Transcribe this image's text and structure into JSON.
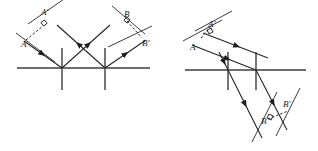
{
  "figure": {
    "title": "Reflection of a light beam by two mirrors (plane-mirror pair) — two configurations",
    "kind": "physics-ray-diagram",
    "background_color": "#ffffff",
    "line_color": "#3d3d3d",
    "ray_color": "#262626",
    "label_color": "#1b1b1b",
    "panels": [
      {
        "id": "left-panel",
        "name": "perpendicular-mirrors-v-configuration",
        "labels": [
          {
            "key": "A",
            "text": "A",
            "x": 21,
            "y": 47
          },
          {
            "key": "A_prime",
            "text": "A'",
            "x": 41,
            "y": 15
          },
          {
            "key": "B",
            "text": "B",
            "x": 124,
            "y": 17
          },
          {
            "key": "B_prime",
            "text": "B'",
            "x": 142,
            "y": 46
          }
        ],
        "mirror_line": {
          "x1": 17,
          "y1": 68,
          "x2": 150,
          "y2": 68
        },
        "normals": [
          {
            "x": 62,
            "y1": 48,
            "y2": 90
          },
          {
            "x": 105,
            "y1": 48,
            "y2": 90
          }
        ],
        "rays": [
          {
            "name": "incident-ray-A",
            "x1": 24,
            "y1": 41,
            "x2": 62,
            "y2": 68,
            "arrow_at": 0.48
          },
          {
            "name": "reflected-ray-1",
            "x1": 62,
            "y1": 68,
            "x2": 110,
            "y2": 25,
            "arrow_at": 0.55
          },
          {
            "name": "reflected-ray-2",
            "x1": 105,
            "y1": 68,
            "x2": 57,
            "y2": 25,
            "arrow_at": 0.55
          },
          {
            "name": "outgoing-ray-B",
            "x1": 105,
            "y1": 68,
            "x2": 146,
            "y2": 40,
            "arrow_at": 0.5
          }
        ],
        "wavefronts": [
          {
            "name": "wavefront-A",
            "x1": 16,
            "y1": 33,
            "x2": 55,
            "y2": 62
          },
          {
            "name": "wavefront-A-prime",
            "x1": 28,
            "y1": 24,
            "x2": 67,
            "y2": -3
          },
          {
            "name": "wavefront-B",
            "x1": 112,
            "y1": 6,
            "x2": 145,
            "y2": 34
          },
          {
            "name": "wavefront-B-prime",
            "x1": 108,
            "y1": 47,
            "x2": 152,
            "y2": 26
          }
        ],
        "dashed_connectors": [
          {
            "name": "dashed-A-to-A-prime",
            "x1": 26,
            "y1": 40,
            "x2": 43,
            "y2": 26
          },
          {
            "name": "dashed-B-to-B-prime",
            "x1": 127,
            "y1": 21,
            "x2": 142,
            "y2": 38
          }
        ],
        "right_angle_marks": [
          {
            "name": "right-angle-mark-A-prime",
            "cx": 44,
            "cy": 23,
            "rot": -38
          },
          {
            "name": "right-angle-mark-B",
            "cx": 127,
            "cy": 20,
            "rot": 40
          }
        ]
      },
      {
        "id": "right-panel",
        "name": "tilted-mirrors-parallel-configuration",
        "labels": [
          {
            "key": "A",
            "text": "A",
            "x": 190,
            "y": 50
          },
          {
            "key": "A_prime",
            "text": "A'",
            "x": 208,
            "y": 27
          },
          {
            "key": "B",
            "text": "B",
            "x": 261,
            "y": 124
          },
          {
            "key": "B_prime",
            "text": "B'",
            "x": 283,
            "y": 107
          }
        ],
        "mirror_line": {
          "x1": 185,
          "y1": 70,
          "x2": 306,
          "y2": 70
        },
        "normals": [
          {
            "x": 228,
            "y1": 52,
            "y2": 90
          },
          {
            "x": 256,
            "y1": 52,
            "y2": 90
          }
        ],
        "rays": [
          {
            "name": "incident-ray-A",
            "x1": 192,
            "y1": 45,
            "x2": 256,
            "y2": 70,
            "arrow_at": 0.55
          },
          {
            "name": "incident-ray-upper",
            "x1": 203,
            "y1": 33,
            "x2": 268,
            "y2": 58,
            "arrow_at": 0.52
          },
          {
            "name": "reflected-ray-1",
            "x1": 256,
            "y1": 70,
            "x2": 287,
            "y2": 130,
            "arrow_at": 0.55
          },
          {
            "name": "reflected-ray-2",
            "x1": 228,
            "y1": 70,
            "x2": 262,
            "y2": 138,
            "arrow_at": 0.5
          },
          {
            "name": "ray-through-left",
            "x1": 219,
            "y1": 52,
            "x2": 228,
            "y2": 70,
            "arrow_at": 0.55
          }
        ],
        "wavefronts": [
          {
            "name": "wavefront-A",
            "x1": 183,
            "y1": 41,
            "x2": 222,
            "y2": 20
          },
          {
            "name": "wavefront-A-prime",
            "x1": 195,
            "y1": 31,
            "x2": 232,
            "y2": 11
          },
          {
            "name": "wavefront-B",
            "x1": 252,
            "y1": 142,
            "x2": 277,
            "y2": 92
          },
          {
            "name": "wavefront-B-prime",
            "x1": 276,
            "y1": 136,
            "x2": 300,
            "y2": 88
          }
        ],
        "dashed_connectors": [
          {
            "name": "dashed-A-to-A-prime",
            "x1": 201,
            "y1": 38,
            "x2": 211,
            "y2": 26
          },
          {
            "name": "dashed-B-to-B-prime",
            "x1": 268,
            "y1": 119,
            "x2": 288,
            "y2": 111
          }
        ],
        "right_angle_marks": [
          {
            "name": "right-angle-mark-A-prime",
            "cx": 210,
            "cy": 31,
            "rot": -28
          },
          {
            "name": "right-angle-mark-B",
            "cx": 270,
            "cy": 117,
            "rot": 25
          }
        ]
      }
    ]
  }
}
